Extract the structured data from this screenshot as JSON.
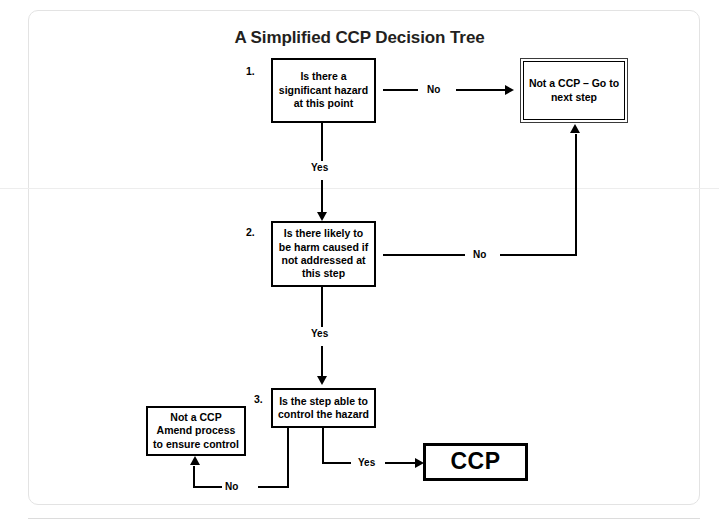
{
  "diagram": {
    "title": "A Simplified CCP Decision Tree",
    "nodes": {
      "q1": {
        "number": "1.",
        "text": "Is there a significant hazard at this point"
      },
      "q2": {
        "number": "2.",
        "text": "Is there likely to be harm caused if not addressed at this step"
      },
      "q3": {
        "number": "3.",
        "text": "Is the step able to control the hazard"
      },
      "not_ccp_next_step": {
        "text": "Not a CCP – Go to next step"
      },
      "not_ccp_amend": {
        "text": "Not a CCP Amend process to ensure control"
      },
      "ccp": {
        "text": "CCP"
      }
    },
    "edges": {
      "q1_no": "No",
      "q1_yes": "Yes",
      "q2_no": "No",
      "q2_yes": "Yes",
      "q3_no": "No",
      "q3_yes": "Yes"
    },
    "colors": {
      "line": "#000000",
      "text": "#000000",
      "card_border": "#e3e3e3",
      "background": "#ffffff"
    }
  }
}
